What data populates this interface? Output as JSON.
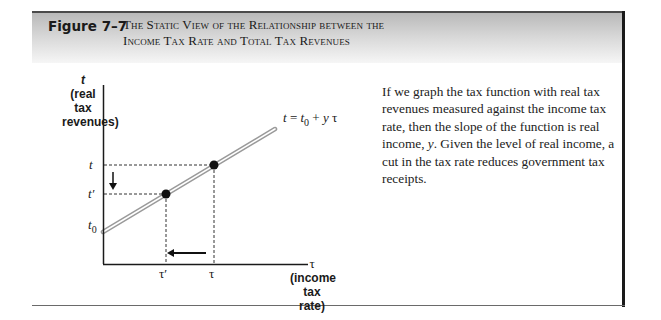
{
  "figure": {
    "label": "Figure 7–7",
    "title_line1": "The Static View of the Relationship between the",
    "title_line2": "Income Tax Rate and Total Tax Revenues"
  },
  "diagram": {
    "y_axis": {
      "symbol": "t",
      "label_line1": "(real tax",
      "label_line2": "revenues)",
      "ticks": [
        "t",
        "t′",
        "t0"
      ]
    },
    "x_axis": {
      "symbol": "τ",
      "label_line1": "(income",
      "label_line2": "tax rate)",
      "ticks": [
        "τ′",
        "τ"
      ]
    },
    "equation": {
      "lhs": "t",
      "eq": " = ",
      "t0_base": "t",
      "t0_sub": "0",
      "rest": " + ",
      "y": "y",
      "tau": "τ"
    },
    "points": [
      {
        "name": "lower",
        "x_label": "τ′",
        "y_label": "t′"
      },
      {
        "name": "upper",
        "x_label": "τ",
        "y_label": "t"
      }
    ],
    "arrows": [
      "down: t to t′",
      "left: τ to τ′"
    ],
    "colors": {
      "line_outer": "#9a9a9a",
      "line_inner": "#ffffff",
      "axis": "#1a1a1a",
      "header_band_top": "#b9b9b9"
    }
  },
  "caption": {
    "part1": "If we graph the tax function with real tax revenues measured against the income tax rate, then the slope of the function is real income, ",
    "y": "y",
    "part2": ". Given the level of real income, a cut in the tax rate reduces government tax receipts."
  }
}
